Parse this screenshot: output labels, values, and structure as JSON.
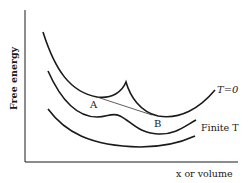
{
  "diagram": {
    "y_axis_label": "Free energy",
    "x_axis_label": "x or volume",
    "point_a_label": "A",
    "point_b_label": "B",
    "curves": [
      {
        "name": "T=0",
        "label": "T=0"
      },
      {
        "name": "Finite T",
        "label": "Finite T"
      },
      {
        "name": "high T",
        "label": ""
      }
    ],
    "colors": {
      "ink": "#1a1a1a",
      "tie_line": "#333333",
      "background": "#ffffff"
    }
  }
}
